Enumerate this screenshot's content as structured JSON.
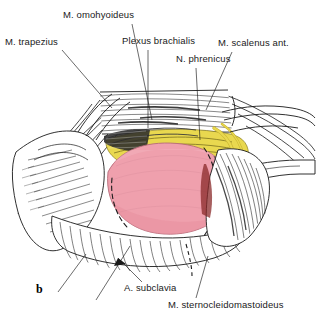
{
  "figure": {
    "marker": "b",
    "kind": "surgical-anatomy-illustration",
    "region": "supraclavicular / lower lateral neck dissection",
    "background_color": "#ffffff",
    "ink_color": "#1a1a1a"
  },
  "palette": {
    "muscle_pink": "#efa0ad",
    "muscle_pink_shadow": "#e0808f",
    "nerve_yellow": "#e9d84f",
    "nerve_yellow_dark": "#cbb733",
    "tissue_white": "#ffffff",
    "outline": "#1a1a1a",
    "deep_shadow": "#3a3a3a"
  },
  "labels": [
    {
      "id": "m-trapezius",
      "text": "M. trapezius",
      "x": 5,
      "y": 45,
      "anchor": "start",
      "leader": [
        [
          62,
          50
        ],
        [
          112,
          108
        ]
      ]
    },
    {
      "id": "m-omohyoideus",
      "text": "M. omohyoideus",
      "x": 63,
      "y": 18,
      "anchor": "start",
      "leader": [
        [
          132,
          24
        ],
        [
          152,
          120
        ]
      ]
    },
    {
      "id": "plexus-brachialis",
      "text": "Plexus brachialis",
      "x": 122,
      "y": 44,
      "anchor": "start",
      "leader": [
        [
          148,
          50
        ],
        [
          148,
          128
        ]
      ]
    },
    {
      "id": "n-phrenicus",
      "text": "N. phrenicus",
      "x": 176,
      "y": 62,
      "anchor": "start",
      "leader": [
        [
          196,
          68
        ],
        [
          200,
          140
        ]
      ]
    },
    {
      "id": "m-scalenus-ant",
      "text": "M. scalenus ant.",
      "x": 218,
      "y": 46,
      "anchor": "start",
      "leader": [
        [
          232,
          52
        ],
        [
          206,
          110
        ]
      ]
    },
    {
      "id": "a-subclavia",
      "text": "A. subclavia",
      "x": 124,
      "y": 291,
      "anchor": "start",
      "leader": [
        [
          142,
          282
        ],
        [
          124,
          262
        ]
      ],
      "arrow": true
    },
    {
      "id": "m-sternocleidomastoideus",
      "text": "M. sternocleidomastoideus",
      "x": 168,
      "y": 308,
      "anchor": "start",
      "leader": [
        [
          196,
          298
        ],
        [
          208,
          256
        ]
      ]
    }
  ]
}
